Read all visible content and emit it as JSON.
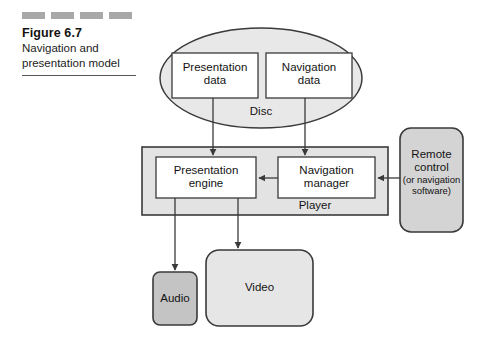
{
  "caption": {
    "figure_number": "Figure 6.7",
    "title_line1": "Navigation and",
    "title_line2": "presentation model",
    "dash_segments": 4
  },
  "diagram": {
    "type": "block-diagram",
    "disc": {
      "label": "Disc",
      "shape": "ellipse",
      "fill": "#e8e8e8",
      "children": [
        {
          "id": "presentation-data",
          "line1": "Presentation",
          "line2": "data",
          "fill": "#ffffff"
        },
        {
          "id": "navigation-data",
          "line1": "Navigation",
          "line2": "data",
          "fill": "#ffffff"
        }
      ]
    },
    "player": {
      "label": "Player",
      "shape": "rectangle",
      "fill": "#e3e3e3",
      "children": [
        {
          "id": "presentation-engine",
          "line1": "Presentation",
          "line2": "engine",
          "fill": "#ffffff"
        },
        {
          "id": "navigation-manager",
          "line1": "Navigation",
          "line2": "manager",
          "fill": "#ffffff"
        }
      ]
    },
    "remote_control": {
      "id": "remote-control",
      "line1": "Remote",
      "line2": "control",
      "line3": "(or navigation",
      "line4": "software)",
      "shape": "rounded-rectangle",
      "fill": "#d4d4d4"
    },
    "outputs": [
      {
        "id": "audio-output",
        "label": "Audio",
        "shape": "rounded-rectangle",
        "fill": "#c4c4c4"
      },
      {
        "id": "video-output",
        "label": "Video",
        "shape": "rounded-rectangle",
        "fill": "#e6e6e6"
      }
    ],
    "arrows": [
      {
        "from": "presentation-data",
        "to": "presentation-engine",
        "direction": "down"
      },
      {
        "from": "navigation-data",
        "to": "navigation-manager",
        "direction": "down"
      },
      {
        "from": "navigation-manager",
        "to": "presentation-engine",
        "direction": "left"
      },
      {
        "from": "remote-control",
        "to": "navigation-manager",
        "direction": "left"
      },
      {
        "from": "presentation-engine",
        "to": "audio-output",
        "direction": "down"
      },
      {
        "from": "presentation-engine",
        "to": "video-output",
        "direction": "down"
      }
    ]
  },
  "colors": {
    "stroke": "#3a3a3a",
    "text": "#131313",
    "dash_bar": "#a8a8a8",
    "disc_fill": "#e8e8e8",
    "player_fill": "#e3e3e3",
    "remote_fill": "#d4d4d4",
    "audio_fill": "#c4c4c4",
    "video_fill": "#e6e6e6"
  }
}
